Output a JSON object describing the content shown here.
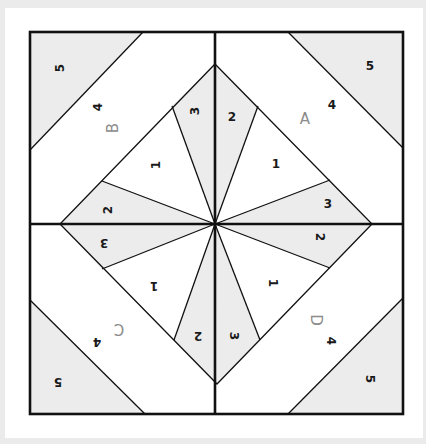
{
  "diagram": {
    "title": "",
    "type": "foundation paper piecing quilt block",
    "colors": {
      "background": "#ebebeb",
      "card": "#ffffff",
      "shaded_fill": "#ececec",
      "white_fill": "#ffffff",
      "line": "#111111",
      "piece_label": "#1a1a1a",
      "section_label": "#8c8c8c"
    },
    "sections": [
      {
        "name": "A",
        "position": "top-right",
        "rotation": 0,
        "pieces": [
          {
            "number": "1",
            "fill": "white"
          },
          {
            "number": "2",
            "fill": "shaded"
          },
          {
            "number": "3",
            "fill": "shaded"
          },
          {
            "number": "4",
            "fill": "white"
          },
          {
            "number": "5",
            "fill": "shaded"
          }
        ]
      },
      {
        "name": "B",
        "position": "top-left",
        "rotation": -90,
        "pieces": [
          {
            "number": "1",
            "fill": "white"
          },
          {
            "number": "2",
            "fill": "shaded"
          },
          {
            "number": "3",
            "fill": "shaded"
          },
          {
            "number": "4",
            "fill": "white"
          },
          {
            "number": "5",
            "fill": "shaded"
          }
        ]
      },
      {
        "name": "C",
        "position": "bottom-left",
        "rotation": 180,
        "pieces": [
          {
            "number": "1",
            "fill": "white"
          },
          {
            "number": "2",
            "fill": "shaded"
          },
          {
            "number": "3",
            "fill": "shaded"
          },
          {
            "number": "4",
            "fill": "white"
          },
          {
            "number": "5",
            "fill": "shaded"
          }
        ]
      },
      {
        "name": "D",
        "position": "bottom-right",
        "rotation": 90,
        "pieces": [
          {
            "number": "1",
            "fill": "white"
          },
          {
            "number": "2",
            "fill": "shaded"
          },
          {
            "number": "3",
            "fill": "shaded"
          },
          {
            "number": "4",
            "fill": "white"
          },
          {
            "number": "5",
            "fill": "shaded"
          }
        ]
      }
    ],
    "labels": {
      "A": {
        "section": "A",
        "p1": "1",
        "p2": "2",
        "p3": "3",
        "p4": "4",
        "p5": "5"
      },
      "B": {
        "section": "B",
        "p1": "1",
        "p2": "2",
        "p3": "3",
        "p4": "4",
        "p5": "5"
      },
      "C": {
        "section": "C",
        "p1": "1",
        "p2": "2",
        "p3": "3",
        "p4": "4",
        "p5": "5"
      },
      "D": {
        "section": "D",
        "p1": "1",
        "p2": "2",
        "p3": "3",
        "p4": "4",
        "p5": "5"
      }
    }
  }
}
